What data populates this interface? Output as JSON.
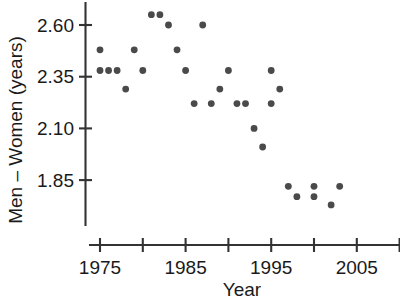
{
  "chart_data": {
    "type": "scatter",
    "title": "",
    "xlabel": "Year",
    "ylabel": "Men – Women (years)",
    "xlim": [
      1973.8,
      2010.2
    ],
    "ylim": [
      1.7,
      2.68
    ],
    "grid": false,
    "legend": null,
    "marker_color": "#4a4a4a",
    "axis_color": "#333333",
    "xticks": [
      1975,
      1980,
      1985,
      1990,
      1995,
      2000,
      2005,
      2010
    ],
    "xtick_labels": [
      "1975",
      "",
      "1985",
      "",
      "1995",
      "",
      "2005",
      ""
    ],
    "yticks": [
      2.6,
      2.35,
      2.1,
      1.85
    ],
    "ytick_labels": [
      "2.60",
      "2.35",
      "2.10",
      "1.85"
    ],
    "points": [
      {
        "x": 1975,
        "y": 2.38
      },
      {
        "x": 1975,
        "y": 2.48
      },
      {
        "x": 1976,
        "y": 2.38
      },
      {
        "x": 1977,
        "y": 2.38
      },
      {
        "x": 1978,
        "y": 2.29
      },
      {
        "x": 1979,
        "y": 2.48
      },
      {
        "x": 1980,
        "y": 2.38
      },
      {
        "x": 1981,
        "y": 2.65
      },
      {
        "x": 1982,
        "y": 2.65
      },
      {
        "x": 1983,
        "y": 2.6
      },
      {
        "x": 1984,
        "y": 2.48
      },
      {
        "x": 1985,
        "y": 2.38
      },
      {
        "x": 1986,
        "y": 2.22
      },
      {
        "x": 1987,
        "y": 2.6
      },
      {
        "x": 1988,
        "y": 2.22
      },
      {
        "x": 1989,
        "y": 2.29
      },
      {
        "x": 1990,
        "y": 2.38
      },
      {
        "x": 1991,
        "y": 2.22
      },
      {
        "x": 1992,
        "y": 2.22
      },
      {
        "x": 1993,
        "y": 2.1
      },
      {
        "x": 1994,
        "y": 2.01
      },
      {
        "x": 1995,
        "y": 2.22
      },
      {
        "x": 1995,
        "y": 2.38
      },
      {
        "x": 1996,
        "y": 2.29
      },
      {
        "x": 1997,
        "y": 1.82
      },
      {
        "x": 1998,
        "y": 1.77
      },
      {
        "x": 2000,
        "y": 1.77
      },
      {
        "x": 2000,
        "y": 1.82
      },
      {
        "x": 2002,
        "y": 1.73
      },
      {
        "x": 2003,
        "y": 1.82
      }
    ]
  }
}
